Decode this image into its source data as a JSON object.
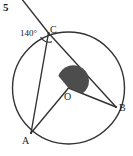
{
  "figure": {
    "problem_number": "5",
    "stroke_color": "#333333",
    "fill_color": "#4d4d4d",
    "background_color": "#ffffff",
    "labels": {
      "center": "O",
      "point_a": "A",
      "point_b": "B",
      "point_c": "C",
      "angle_at_c": "140°"
    },
    "geometry": {
      "type": "circle-with-inscribed-angle",
      "circle": {
        "cx": 68.5,
        "cy": 88,
        "r": 56
      },
      "points": {
        "A": {
          "x": 31,
          "y": 133
        },
        "B": {
          "x": 116,
          "y": 107
        },
        "C": {
          "x": 48.5,
          "y": 33
        },
        "O": {
          "x": 68.5,
          "y": 88
        }
      },
      "secant_external_point": {
        "x": 21,
        "y": -1
      },
      "segments": [
        {
          "from": "C",
          "to": "A",
          "name": "chord-ca"
        },
        {
          "from": "C",
          "to": "B",
          "name": "chord-cb"
        },
        {
          "from": "O",
          "to": "A",
          "name": "radius-oa"
        },
        {
          "from": "O",
          "to": "B",
          "name": "radius-ob"
        },
        {
          "from": "external",
          "to": "C",
          "name": "secant-ray"
        }
      ],
      "angle_markers": [
        {
          "name": "angle-arc-at-c",
          "vertex": "C",
          "value": "140°",
          "style": "open-arc"
        },
        {
          "name": "central-angle-shaded-at-o",
          "vertex": "O",
          "style": "filled-sector"
        }
      ]
    }
  }
}
